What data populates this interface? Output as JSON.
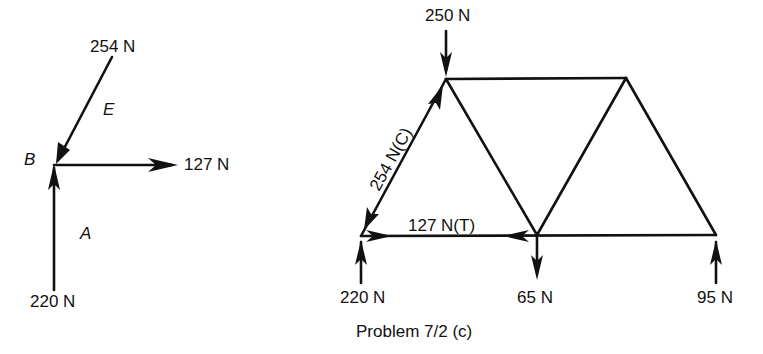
{
  "fbd": {
    "joint_label": "B",
    "region_labels": {
      "upper": "E",
      "lower": "A"
    },
    "forces": {
      "diagonal": "254 N",
      "horizontal": "127 N",
      "vertical": "220 N"
    }
  },
  "truss": {
    "applied_load_top": "250 N",
    "member_diagonal": "254 N(C)",
    "member_bottom": "127 N(T)",
    "reaction_left": "220 N",
    "load_bottom_mid": "65 N",
    "reaction_right": "95 N"
  },
  "caption": "Problem 7/2 (c)"
}
